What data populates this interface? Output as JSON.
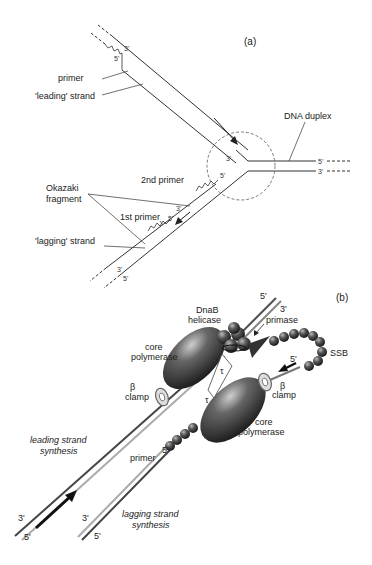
{
  "panel_a": {
    "tag": "(a)",
    "labels": {
      "primer": "primer",
      "leading_strand": "'leading' strand",
      "dna_duplex": "DNA duplex",
      "second_primer": "2nd primer",
      "okazaki_line1": "Okazaki",
      "okazaki_line2": "fragment",
      "first_primer": "1st primer",
      "lagging_strand": "'lagging' strand"
    },
    "ends": {
      "top_outer": "3'",
      "top_inner": "5'",
      "fork_3": "3'",
      "duplex_top": "5'",
      "duplex_bottom": "3'",
      "second_primer_3": "3'",
      "second_primer_5": "5'",
      "first_primer_3": "3'",
      "first_primer_5": "5'",
      "bottom_inner": "3'",
      "bottom_outer": "5'"
    }
  },
  "panel_b": {
    "tag": "(b)",
    "labels": {
      "dnab_line1": "DnaB",
      "dnab_line2": "helicase",
      "primase": "primase",
      "ssb": "SSB",
      "core_pol_top_1": "core",
      "core_pol_top_2": "polymerase",
      "clamp_left_1": "β",
      "clamp_left_2": "clamp",
      "clamp_right_1": "β",
      "clamp_right_2": "clamp",
      "core_pol_bottom_1": "core",
      "core_pol_bottom_2": "polymerase",
      "tau_1": "τ",
      "tau_2": "τ",
      "primer": "primer",
      "leading_1": "leading strand",
      "leading_2": "synthesis",
      "lagging_1": "lagging strand",
      "lagging_2": "synthesis"
    },
    "ends": {
      "top_5": "5'",
      "top_3": "3'",
      "ssb_5": "5'",
      "primer_5": "5'",
      "lead_3": "3'",
      "lead_5": "5'",
      "lag_3": "3'",
      "lag_5": "5'"
    }
  }
}
